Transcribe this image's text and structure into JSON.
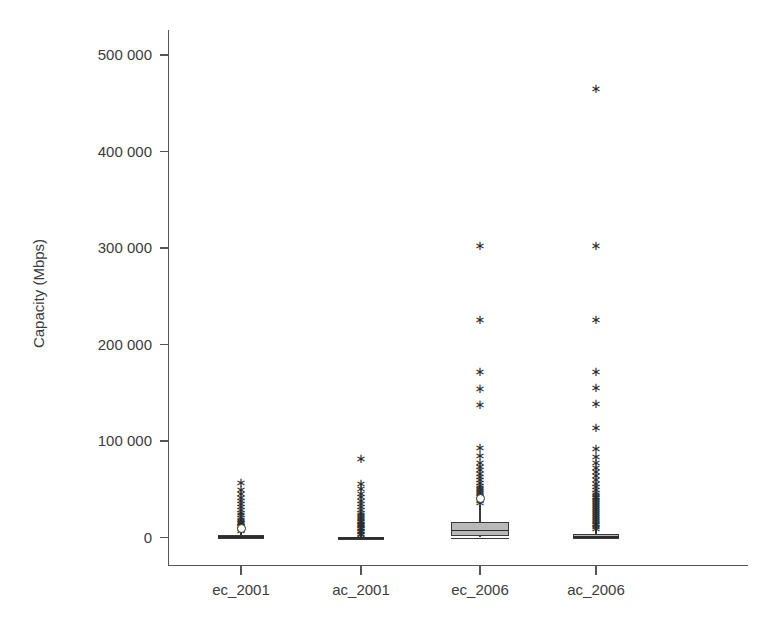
{
  "chart_data": {
    "type": "box",
    "title": "",
    "xlabel": "",
    "ylabel": "Capacity (Mbps)",
    "ylim": [
      -20000,
      540000
    ],
    "yticks": [
      0,
      100000,
      200000,
      300000,
      400000,
      500000
    ],
    "ytick_labels": [
      "0",
      "100 000",
      "200 000",
      "300 000",
      "400 000",
      "500 000"
    ],
    "categories": [
      "ec_2001",
      "ac_2001",
      "ec_2006",
      "ac_2006"
    ],
    "grid": false,
    "legend": "none",
    "box_fill_color": "#b9b9b9",
    "line_color": "#3a3a3a",
    "outlier_marker": "asterisk",
    "series": [
      {
        "name": "ec_2001",
        "whisker_low": 0,
        "q1": 0,
        "median": 1200,
        "q3": 2600,
        "whisker_high": 5200,
        "circles": [
          9000
        ],
        "outliers": [
          7000,
          9500,
          11000,
          12500,
          14000,
          15500,
          17000,
          19000,
          21000,
          24000,
          26000,
          29000,
          32000,
          35000,
          38000,
          41000,
          46000,
          50000,
          57000
        ]
      },
      {
        "name": "ac_2001",
        "whisker_low": 0,
        "q1": 0,
        "median": 400,
        "q3": 900,
        "whisker_high": 2000,
        "circles": [],
        "outliers": [
          3000,
          4500,
          6000,
          7500,
          9000,
          10500,
          12000,
          13500,
          15000,
          16500,
          18000,
          20000,
          22000,
          24000,
          26000,
          29000,
          32000,
          35000,
          38000,
          42000,
          46000,
          51000,
          56000,
          82000
        ]
      },
      {
        "name": "ec_2006",
        "whisker_low": 0,
        "q1": 1500,
        "median": 8000,
        "q3": 16000,
        "whisker_high": 34000,
        "circles": [
          40000
        ],
        "outliers": [
          36000,
          38000,
          42000,
          44000,
          46000,
          48000,
          50000,
          52000,
          54000,
          57000,
          60000,
          63000,
          66000,
          70000,
          74000,
          78000,
          85000,
          93000,
          138000,
          154000,
          172000,
          226000,
          303000
        ]
      },
      {
        "name": "ac_2006",
        "whisker_low": 0,
        "q1": 0,
        "median": 1600,
        "q3": 3400,
        "whisker_high": 8000,
        "circles": [],
        "outliers": [
          9000,
          11000,
          13000,
          15000,
          17000,
          19000,
          21000,
          23000,
          25000,
          27000,
          29000,
          31000,
          33000,
          35000,
          37000,
          39000,
          41000,
          43000,
          45000,
          47000,
          50000,
          53000,
          56000,
          60000,
          64000,
          68000,
          73000,
          78000,
          84000,
          92000,
          114000,
          139000,
          155000,
          172000,
          226000,
          303000,
          465000
        ]
      }
    ]
  }
}
